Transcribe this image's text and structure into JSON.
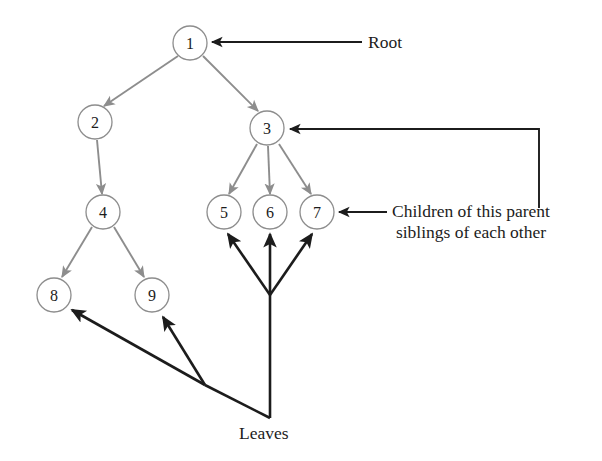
{
  "diagram": {
    "type": "tree-diagram",
    "colors": {
      "edge": "#8d8d8d",
      "node_stroke": "#8d8d8d",
      "node_fill": "#ffffff",
      "annotation": "#1c1c1c",
      "background": "#ffffff"
    },
    "nodes": [
      {
        "id": "n1",
        "label": "1",
        "cx": 190,
        "cy": 43,
        "r": 17
      },
      {
        "id": "n2",
        "label": "2",
        "cx": 95,
        "cy": 122,
        "r": 17
      },
      {
        "id": "n3",
        "label": "3",
        "cx": 267,
        "cy": 128,
        "r": 17
      },
      {
        "id": "n4",
        "label": "4",
        "cx": 103,
        "cy": 212,
        "r": 17
      },
      {
        "id": "n5",
        "label": "5",
        "cx": 224,
        "cy": 212,
        "r": 17
      },
      {
        "id": "n6",
        "label": "6",
        "cx": 270,
        "cy": 212,
        "r": 17
      },
      {
        "id": "n7",
        "label": "7",
        "cx": 317,
        "cy": 212,
        "r": 17
      },
      {
        "id": "n8",
        "label": "8",
        "cx": 54,
        "cy": 295,
        "r": 17
      },
      {
        "id": "n9",
        "label": "9",
        "cx": 152,
        "cy": 295,
        "r": 17
      }
    ],
    "edges": [
      {
        "from": "1",
        "to": "2"
      },
      {
        "from": "1",
        "to": "3"
      },
      {
        "from": "2",
        "to": "4"
      },
      {
        "from": "3",
        "to": "5"
      },
      {
        "from": "3",
        "to": "6"
      },
      {
        "from": "3",
        "to": "7"
      },
      {
        "from": "4",
        "to": "8"
      },
      {
        "from": "4",
        "to": "9"
      }
    ],
    "annotations": {
      "root": {
        "text": "Root",
        "points_to": "1"
      },
      "children": {
        "line1": "Children of this parent",
        "line2": "siblings of each other",
        "points_to": "7, 3"
      },
      "leaves": {
        "text": "Leaves",
        "points_to": "5, 6, 7, 8, 9"
      }
    }
  }
}
